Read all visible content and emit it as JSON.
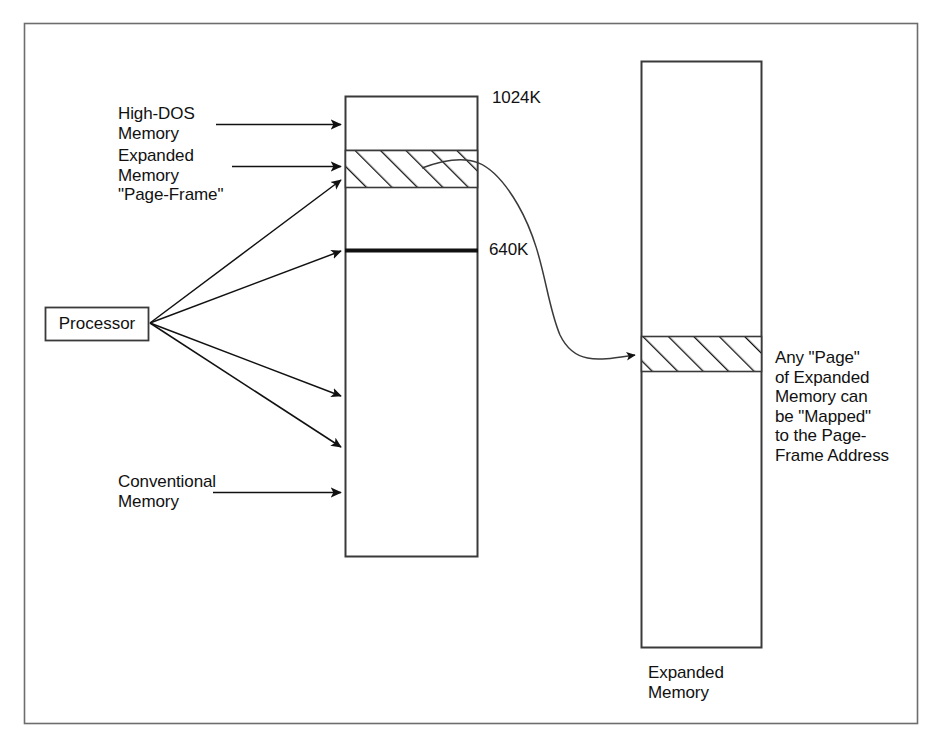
{
  "figure": {
    "type": "memory-map-diagram",
    "background_color": "#ffffff",
    "ink_color": "#111111",
    "frame": {
      "label": "outer-border"
    }
  },
  "processor": {
    "label": "Processor"
  },
  "left_labels": {
    "high_dos": "High-DOS\nMemory",
    "page_frame": "Expanded\nMemory\n\"Page-Frame\"",
    "conventional": "Conventional\nMemory"
  },
  "address_markers": {
    "top": "1024K",
    "boundary": "640K"
  },
  "expanded_memory": {
    "caption": "Expanded\nMemory",
    "note": "Any \"Page\"\nof Expanded\nMemory can\nbe \"Mapped\"\nto the Page-\nFrame Address"
  },
  "regions": [
    {
      "name": "high-dos-memory",
      "from": "640K",
      "to": "1024K"
    },
    {
      "name": "expanded-memory-page-frame",
      "hatched": true
    },
    {
      "name": "conventional-memory",
      "from": "0K",
      "to": "640K"
    }
  ]
}
